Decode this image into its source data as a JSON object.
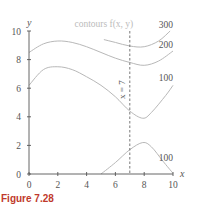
{
  "figure": {
    "caption": "Figure 7.28"
  },
  "chart_data": {
    "type": "line",
    "title": "contours f(x, y)",
    "xlabel": "x",
    "ylabel": "y",
    "xlim": [
      0,
      10
    ],
    "ylim": [
      0,
      10
    ],
    "x_ticks": [
      0,
      2,
      4,
      6,
      8,
      10
    ],
    "y_ticks": [
      0,
      2,
      4,
      6,
      8,
      10
    ],
    "grid": false,
    "annotations": [
      {
        "text": "contours f(x, y)",
        "x": 5.2,
        "y": 10.3
      },
      {
        "text": "x = 7",
        "x": 6.7,
        "y": 5.9,
        "rotated": true
      },
      {
        "text": "300",
        "x": 9.5,
        "y": 10.2
      },
      {
        "text": "200",
        "x": 9.5,
        "y": 8.8
      },
      {
        "text": "100",
        "x": 9.5,
        "y": 6.5
      },
      {
        "text": "100",
        "x": 9.5,
        "y": 0.9
      }
    ],
    "vertical_line": {
      "x": 7,
      "style": "dashed",
      "label": "x = 7"
    },
    "series": [
      {
        "name": "300",
        "points": [
          [
            5.2,
            9.4
          ],
          [
            6.0,
            9.2
          ],
          [
            7.0,
            8.95
          ],
          [
            8.0,
            8.9
          ],
          [
            9.0,
            9.3
          ],
          [
            9.8,
            10.0
          ]
        ]
      },
      {
        "name": "200",
        "points": [
          [
            0,
            8.5
          ],
          [
            1.0,
            9.1
          ],
          [
            2.0,
            9.3
          ],
          [
            3.0,
            9.2
          ],
          [
            4.0,
            8.9
          ],
          [
            5.0,
            8.5
          ],
          [
            6.0,
            8.1
          ],
          [
            7.0,
            7.8
          ],
          [
            8.0,
            7.6
          ],
          [
            9.0,
            7.9
          ],
          [
            10.0,
            8.6
          ]
        ]
      },
      {
        "name": "100",
        "points": [
          [
            0,
            6.2
          ],
          [
            1.0,
            7.3
          ],
          [
            2.0,
            7.5
          ],
          [
            3.0,
            7.3
          ],
          [
            4.0,
            6.8
          ],
          [
            5.0,
            6.2
          ],
          [
            6.0,
            5.4
          ],
          [
            7.0,
            4.4
          ],
          [
            7.9,
            3.9
          ],
          [
            8.5,
            4.3
          ],
          [
            9.5,
            5.5
          ],
          [
            10.0,
            6.2
          ]
        ]
      },
      {
        "name": "100 (lower)",
        "points": [
          [
            5.0,
            0
          ],
          [
            6.0,
            0.8
          ],
          [
            7.0,
            1.7
          ],
          [
            7.9,
            2.2
          ],
          [
            8.5,
            1.9
          ],
          [
            9.3,
            0.9
          ],
          [
            10.0,
            0.05
          ]
        ]
      }
    ]
  }
}
